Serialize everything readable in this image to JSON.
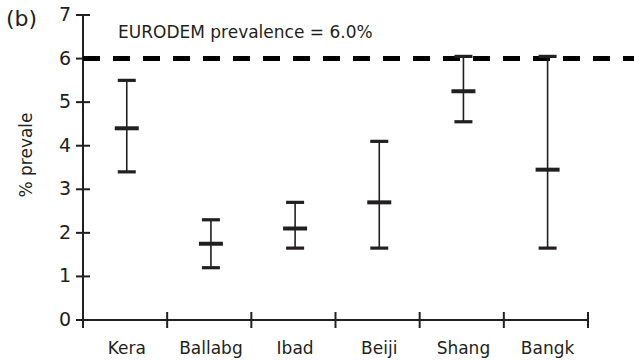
{
  "panel": {
    "label": "(b)"
  },
  "chart_data": {
    "type": "scatter",
    "title": "",
    "xlabel": "",
    "ylabel": "% prevale",
    "ylim": [
      0,
      7
    ],
    "yticks": [
      0,
      1,
      2,
      3,
      4,
      5,
      6,
      7
    ],
    "ytick_labels": [
      "0",
      "1",
      "2",
      "3",
      "4",
      "5",
      "6",
      "7"
    ],
    "grid": false,
    "legend": "none",
    "categories": [
      "Kera",
      "Ballabg",
      "Ibad",
      "Beiji",
      "Shang",
      "Bangk"
    ],
    "series": [
      {
        "name": "prevalence",
        "values": [
          4.4,
          1.75,
          2.1,
          2.7,
          5.25,
          3.45
        ],
        "error_low": [
          3.4,
          1.2,
          1.65,
          1.65,
          4.55,
          1.65
        ],
        "error_high": [
          5.5,
          2.3,
          2.7,
          4.1,
          6.05,
          6.05
        ]
      }
    ],
    "reference_line": {
      "value": 6.0,
      "label": "EURODEM prevalence = 6.0%",
      "style": "dashed",
      "color": "#000000"
    },
    "axis_color": "#231f20",
    "marker_color": "#231f20"
  }
}
